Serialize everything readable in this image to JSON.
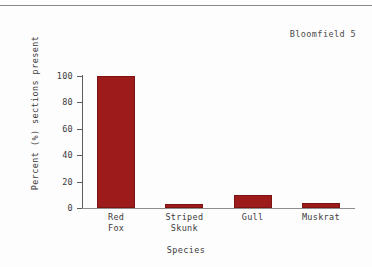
{
  "figure": {
    "label": "Bloomfield 5"
  },
  "chart_data": {
    "type": "bar",
    "title": "",
    "categories": [
      "Red\nFox",
      "Striped\nSkunk",
      "Gull",
      "Muskrat"
    ],
    "category_names": [
      "Red Fox",
      "Striped Skunk",
      "Gull",
      "Muskrat"
    ],
    "values": [
      100,
      3,
      10,
      4
    ],
    "xlabel": "Species",
    "ylabel": "Percent (%) sections present",
    "ylim": [
      0,
      100
    ],
    "yticks": [
      0,
      20,
      40,
      60,
      80,
      100
    ],
    "ytick_labels": [
      "0",
      "20",
      "40",
      "60",
      "80",
      "100"
    ],
    "grid": false,
    "legend": null,
    "bar_color": "#9e1b1b",
    "bar_edge_color": "#7d1414",
    "axis_color": "#5d5d5d"
  }
}
